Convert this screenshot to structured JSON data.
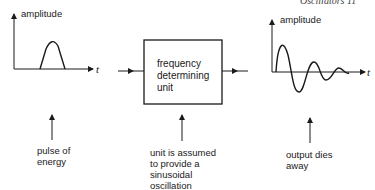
{
  "page_header": "Oscillators   11",
  "left_graph": {
    "y_axis_label": "amplitude",
    "x_axis_label": "t",
    "caption": [
      "pulse of",
      "energy"
    ]
  },
  "center_block": {
    "box_text": [
      "frequency",
      "determining",
      "unit"
    ],
    "caption": [
      "unit is assumed",
      "to provide a",
      "sinusoidal",
      "oscillation"
    ]
  },
  "right_graph": {
    "y_axis_label": "amplitude",
    "x_axis_label": "t",
    "caption": [
      "output dies",
      "away"
    ]
  },
  "colors": {
    "line": "#1a1a1a",
    "background": "#ffffff"
  }
}
